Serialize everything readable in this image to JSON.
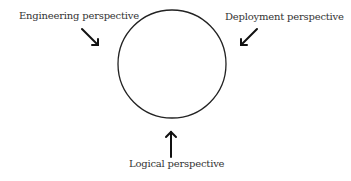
{
  "diagram": {
    "center_shape": "circle",
    "labels": {
      "engineering": "Engineering perspective",
      "deployment": "Deployment perspective",
      "logical": "Logical perspective"
    },
    "arrows": [
      {
        "from": "engineering",
        "direction": "down-right"
      },
      {
        "from": "deployment",
        "direction": "down-left"
      },
      {
        "from": "logical",
        "direction": "up"
      }
    ],
    "colors": {
      "stroke": "#222222",
      "text": "#333333",
      "background": "#ffffff"
    }
  }
}
